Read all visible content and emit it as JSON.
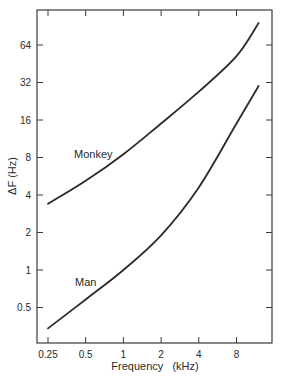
{
  "chart_data": {
    "type": "line",
    "title": "",
    "xlabel": "Frequency (kHz)",
    "ylabel": "ΔF (Hz)",
    "x_scale": "log2",
    "y_scale": "log2",
    "xlim": [
      0.25,
      14
    ],
    "ylim": [
      0.3,
      128
    ],
    "x_ticks": [
      0.25,
      0.5,
      1,
      2,
      4,
      8
    ],
    "x_tick_labels": [
      "0.25",
      "0.5",
      "1",
      "2",
      "4",
      "8"
    ],
    "y_ticks": [
      0.5,
      1,
      2,
      4,
      8,
      16,
      32,
      64
    ],
    "y_tick_labels": [
      "0.5",
      "1",
      "2",
      "4",
      "8",
      "16",
      "32",
      "64"
    ],
    "grid": false,
    "legend": "inline labels",
    "series": [
      {
        "name": "Monkey",
        "x": [
          0.25,
          0.5,
          1,
          2,
          4,
          8,
          12
        ],
        "values": [
          3.4,
          5.2,
          8.5,
          15,
          27,
          52,
          96
        ]
      },
      {
        "name": "Man",
        "x": [
          0.25,
          0.5,
          1,
          2,
          4,
          8,
          12
        ],
        "values": [
          0.34,
          0.58,
          1.0,
          1.9,
          4.6,
          15,
          30
        ]
      }
    ],
    "annotations": [
      {
        "text": "Monkey",
        "x": 0.6,
        "y": 8
      },
      {
        "text": "Man",
        "x": 0.6,
        "y": 0.9
      }
    ]
  },
  "labels": {
    "xlabel": "Frequency   (kHz)",
    "ylabel": "ΔF (Hz)",
    "monkey": "Monkey",
    "man": "Man"
  },
  "colors": {
    "line": "#2a2a2a",
    "axis": "#3a3a3a",
    "background": "#ffffff"
  }
}
